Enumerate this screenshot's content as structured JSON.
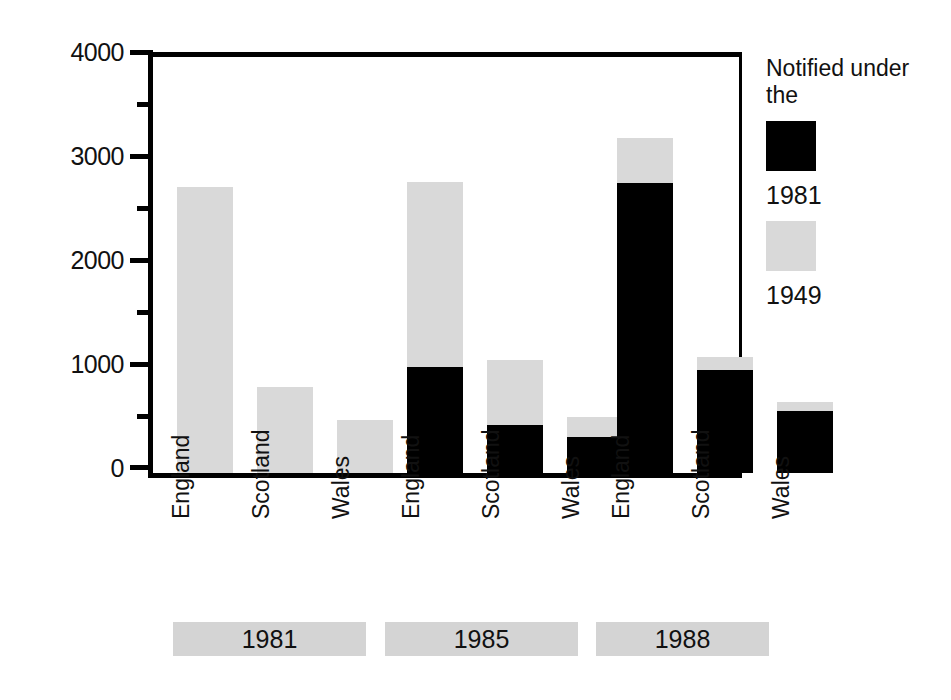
{
  "chart_data": {
    "type": "bar",
    "subtype": "stacked-grouped",
    "title": "",
    "xlabel": "",
    "ylabel": "",
    "ylim": [
      0,
      4000
    ],
    "ytick_labels": [
      "4000",
      "3000",
      "2000",
      "1000",
      "0"
    ],
    "ytick_values": [
      4000,
      3000,
      2000,
      1000,
      0
    ],
    "minor_tick_interval": 500,
    "grid": false,
    "legend_position": "right",
    "categories": [
      "England",
      "Scotland",
      "Wales",
      "England",
      "Scotland",
      "Wales",
      "England",
      "Scotland",
      "Wales"
    ],
    "group_labels": [
      "1981",
      "1985",
      "1988"
    ],
    "groups": [
      {
        "year": "1981",
        "countries": [
          "England",
          "Scotland",
          "Wales"
        ],
        "values_1981": [
          0,
          0,
          0
        ],
        "values_1949": [
          2750,
          830,
          510
        ],
        "totals": [
          2750,
          830,
          510
        ]
      },
      {
        "year": "1985",
        "countries": [
          "England",
          "Scotland",
          "Wales"
        ],
        "values_1981": [
          1020,
          460,
          350
        ],
        "values_1949": [
          1780,
          630,
          190
        ],
        "totals": [
          2800,
          1090,
          540
        ]
      },
      {
        "year": "1988",
        "countries": [
          "England",
          "Scotland",
          "Wales"
        ],
        "values_1981": [
          2790,
          990,
          600
        ],
        "values_1949": [
          430,
          130,
          80
        ],
        "totals": [
          3220,
          1120,
          680
        ]
      }
    ],
    "series": [
      {
        "name": "1981",
        "color": "#000000",
        "values": [
          0,
          0,
          0,
          1020,
          460,
          350,
          2790,
          990,
          600
        ]
      },
      {
        "name": "1949",
        "color": "#d9d9d9",
        "values": [
          2750,
          830,
          510,
          1780,
          630,
          190,
          430,
          130,
          80
        ]
      }
    ]
  },
  "legend": {
    "title": "Notified under the",
    "entries": [
      {
        "label": "1981",
        "color": "#000000",
        "swatch": "black"
      },
      {
        "label": "1949",
        "color": "#d9d9d9",
        "swatch": "gray"
      }
    ]
  },
  "colors": {
    "series_1981": "#000000",
    "series_1949": "#d9d9d9",
    "axis": "#000000",
    "group_band": "#d4d4d4",
    "background": "#ffffff"
  }
}
